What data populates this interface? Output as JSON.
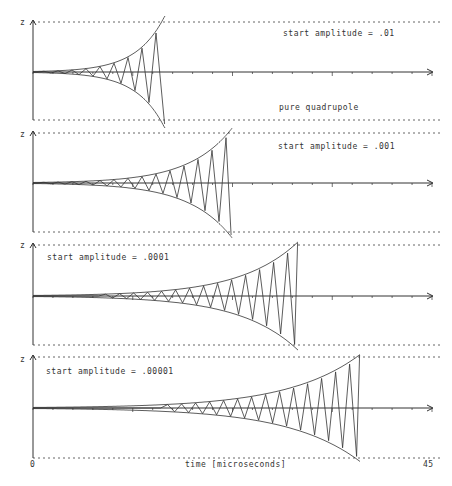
{
  "chart_data": {
    "type": "line",
    "title": "",
    "xlabel": "time  [microseconds]",
    "ylabel": "z",
    "xlim": [
      0,
      45
    ],
    "x_tick_labels": [
      "0",
      "45"
    ],
    "grid": false,
    "annotation_extra": "pure quadrupole",
    "panels": [
      {
        "label": "start amplitude = .01",
        "start_amplitude": 0.01,
        "burst_end_time": 14.5,
        "label_position": "top-right"
      },
      {
        "label": "start amplitude = .001",
        "start_amplitude": 0.001,
        "burst_end_time": 22.0,
        "label_position": "top-right"
      },
      {
        "label": "start amplitude = .0001",
        "start_amplitude": 0.0001,
        "burst_end_time": 29.5,
        "label_position": "top-left"
      },
      {
        "label": "start amplitude = .00001",
        "start_amplitude": 1e-05,
        "burst_end_time": 36.5,
        "label_position": "top-left"
      }
    ]
  },
  "labels": {
    "p1": "start amplitude = .01",
    "p1_extra": "pure quadrupole",
    "p2": "start amplitude = .001",
    "p3": "start amplitude = .0001",
    "p4": "start amplitude = .00001",
    "z": "z",
    "x_min": "0",
    "x_max": "45",
    "xlabel": "time  [microseconds]"
  },
  "style": {
    "ink": "#333333",
    "dotted": "#666666"
  }
}
